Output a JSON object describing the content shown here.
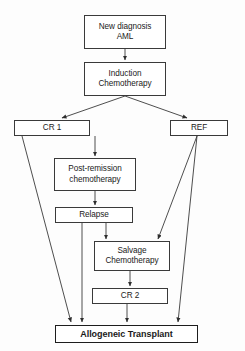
{
  "diagram": {
    "background_color": "#fdfdfd",
    "line_color": "#3a3a3a",
    "text_color": "#1a1a1a",
    "nodes": [
      {
        "id": "new-diagnosis",
        "lines": [
          "New diagnosis",
          "AML"
        ]
      },
      {
        "id": "induction",
        "lines": [
          "Induction",
          "Chemotherapy"
        ]
      },
      {
        "id": "cr1",
        "lines": [
          "CR 1"
        ]
      },
      {
        "id": "ref",
        "lines": [
          "REF"
        ]
      },
      {
        "id": "post-remission",
        "lines": [
          "Post-remission",
          "chemotherapy"
        ]
      },
      {
        "id": "relapse",
        "lines": [
          "Relapse"
        ]
      },
      {
        "id": "salvage",
        "lines": [
          "Salvage",
          "Chemotherapy"
        ]
      },
      {
        "id": "cr2",
        "lines": [
          "CR 2"
        ]
      },
      {
        "id": "allogeneic",
        "lines": [
          "Allogeneic Transplant"
        ]
      }
    ],
    "edges": [
      {
        "from": "new-diagnosis",
        "to": "induction"
      },
      {
        "from": "induction",
        "to": "cr1"
      },
      {
        "from": "induction",
        "to": "ref"
      },
      {
        "from": "cr1",
        "to": "post-remission"
      },
      {
        "from": "cr1",
        "to": "allogeneic"
      },
      {
        "from": "post-remission",
        "to": "relapse"
      },
      {
        "from": "relapse",
        "to": "salvage"
      },
      {
        "from": "relapse",
        "to": "allogeneic"
      },
      {
        "from": "ref",
        "to": "salvage"
      },
      {
        "from": "ref",
        "to": "allogeneic"
      },
      {
        "from": "salvage",
        "to": "cr2"
      },
      {
        "from": "cr2",
        "to": "allogeneic"
      }
    ]
  }
}
